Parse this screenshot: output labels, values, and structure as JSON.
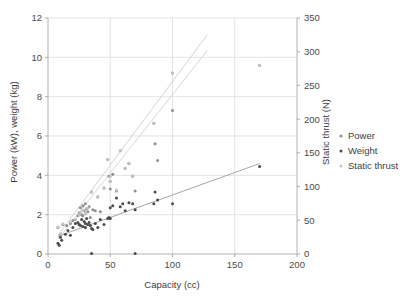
{
  "chart_data": {
    "type": "scatter",
    "title": "",
    "xlabel": "Capacity (cc)",
    "ylabel": "Power (kW), weight (kg)",
    "y2label": "Static thrust (N)",
    "xlim": [
      0,
      200
    ],
    "ylim": [
      0,
      12
    ],
    "y2lim": [
      0,
      350
    ],
    "xticks": [
      "0",
      "50",
      "100",
      "150",
      "200"
    ],
    "xtick_values": [
      0,
      50,
      100,
      150,
      200
    ],
    "yticks": [
      "0",
      "2",
      "4",
      "6",
      "8",
      "10",
      "12"
    ],
    "ytick_values": [
      0,
      2,
      4,
      6,
      8,
      10,
      12
    ],
    "y2ticks": [
      "0",
      "50",
      "100",
      "150",
      "200",
      "250",
      "300",
      "350"
    ],
    "y2tick_values": [
      0,
      50,
      100,
      150,
      200,
      250,
      300,
      350
    ],
    "grid": true,
    "legend_position": "right",
    "series": [
      {
        "name": "Power",
        "axis": "left",
        "color": "#8f8f8f",
        "marker": "circle",
        "points": [
          [
            8,
            1.35
          ],
          [
            10,
            1.0
          ],
          [
            12,
            1.5
          ],
          [
            15,
            1.45
          ],
          [
            18,
            1.55
          ],
          [
            20,
            1.7
          ],
          [
            22,
            1.75
          ],
          [
            24,
            1.95
          ],
          [
            25,
            2.1
          ],
          [
            26,
            2.35
          ],
          [
            27,
            2.0
          ],
          [
            28,
            2.45
          ],
          [
            28,
            1.95
          ],
          [
            29,
            2.2
          ],
          [
            30,
            2.05
          ],
          [
            30,
            2.55
          ],
          [
            31,
            2.3
          ],
          [
            32,
            2.15
          ],
          [
            33,
            2.4
          ],
          [
            34,
            1.85
          ],
          [
            35,
            3.15
          ],
          [
            36,
            2.25
          ],
          [
            38,
            2.2
          ],
          [
            40,
            2.9
          ],
          [
            42,
            2.15
          ],
          [
            45,
            3.35
          ],
          [
            48,
            4.8
          ],
          [
            49,
            3.95
          ],
          [
            50,
            3.7
          ],
          [
            50,
            3.3
          ],
          [
            52,
            4.05
          ],
          [
            55,
            3.2
          ],
          [
            58,
            5.25
          ],
          [
            62,
            4.35
          ],
          [
            65,
            4.6
          ],
          [
            68,
            3.95
          ],
          [
            70,
            3.2
          ],
          [
            85,
            6.65
          ],
          [
            86,
            5.6
          ],
          [
            88,
            4.75
          ],
          [
            100,
            9.2
          ],
          [
            100,
            7.3
          ],
          [
            170,
            9.6
          ]
        ]
      },
      {
        "name": "Weight",
        "axis": "left",
        "color": "#4a4a4a",
        "marker": "circle",
        "points": [
          [
            8,
            0.55
          ],
          [
            9,
            0.45
          ],
          [
            10,
            0.85
          ],
          [
            11,
            0.7
          ],
          [
            14,
            1.0
          ],
          [
            16,
            1.2
          ],
          [
            18,
            0.95
          ],
          [
            20,
            1.35
          ],
          [
            22,
            1.55
          ],
          [
            24,
            1.6
          ],
          [
            25,
            1.5
          ],
          [
            26,
            1.45
          ],
          [
            27,
            1.75
          ],
          [
            28,
            1.4
          ],
          [
            29,
            1.65
          ],
          [
            30,
            1.55
          ],
          [
            30,
            1.35
          ],
          [
            31,
            1.8
          ],
          [
            32,
            1.5
          ],
          [
            33,
            1.6
          ],
          [
            34,
            1.45
          ],
          [
            35,
            1.3
          ],
          [
            35,
            0.02
          ],
          [
            36,
            1.25
          ],
          [
            38,
            1.55
          ],
          [
            40,
            1.35
          ],
          [
            42,
            1.75
          ],
          [
            45,
            1.5
          ],
          [
            48,
            1.8
          ],
          [
            49,
            1.85
          ],
          [
            50,
            2.35
          ],
          [
            50,
            1.8
          ],
          [
            52,
            2.45
          ],
          [
            55,
            2.85
          ],
          [
            58,
            2.4
          ],
          [
            60,
            2.55
          ],
          [
            62,
            2.2
          ],
          [
            65,
            2.6
          ],
          [
            68,
            2.55
          ],
          [
            70,
            2.25
          ],
          [
            70,
            0.02
          ],
          [
            85,
            2.55
          ],
          [
            86,
            3.15
          ],
          [
            88,
            2.75
          ],
          [
            100,
            2.55
          ],
          [
            170,
            4.45
          ]
        ]
      },
      {
        "name": "Static thrust",
        "axis": "right",
        "color": "#c4c4c4",
        "marker": "circle",
        "points": [
          [
            8,
            40
          ],
          [
            10,
            30
          ],
          [
            12,
            45
          ],
          [
            18,
            48
          ],
          [
            22,
            52
          ],
          [
            25,
            58
          ],
          [
            26,
            62
          ],
          [
            28,
            65
          ],
          [
            30,
            60
          ],
          [
            32,
            68
          ],
          [
            35,
            92
          ],
          [
            40,
            85
          ],
          [
            45,
            98
          ],
          [
            48,
            140
          ],
          [
            50,
            115
          ],
          [
            50,
            108
          ],
          [
            55,
            95
          ],
          [
            58,
            153
          ],
          [
            62,
            127
          ],
          [
            65,
            135
          ],
          [
            68,
            116
          ],
          [
            85,
            194
          ],
          [
            100,
            268
          ],
          [
            170,
            280
          ]
        ]
      }
    ],
    "trendlines": [
      {
        "name": "static-thrust-trend",
        "color": "#cfcfcf",
        "x": [
          8,
          128
        ],
        "y": [
          0.95,
          11.15
        ],
        "axis": "left"
      },
      {
        "name": "power-trend",
        "color": "#d4d4d4",
        "x": [
          8,
          128
        ],
        "y": [
          0.75,
          10.35
        ],
        "axis": "left"
      },
      {
        "name": "weight-trend",
        "color": "#9b9b9b",
        "x": [
          8,
          170
        ],
        "y": [
          0.9,
          4.6
        ],
        "axis": "left"
      }
    ],
    "legend": [
      {
        "label": "Power",
        "color": "#8f8f8f"
      },
      {
        "label": "Weight",
        "color": "#4a4a4a"
      },
      {
        "label": "Static thrust",
        "color": "#c4c4c4"
      }
    ]
  }
}
